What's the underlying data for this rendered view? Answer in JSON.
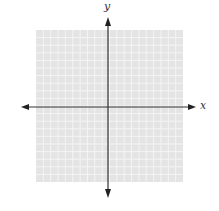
{
  "diagram": {
    "type": "coordinate-plane",
    "x_axis_label": "x",
    "y_axis_label": "y",
    "grid": {
      "columns": 20,
      "rows": 20
    },
    "colors": {
      "grid_background": "#e4e4e4",
      "grid_lines": "#f4f4f4",
      "axes": "#333333"
    }
  }
}
